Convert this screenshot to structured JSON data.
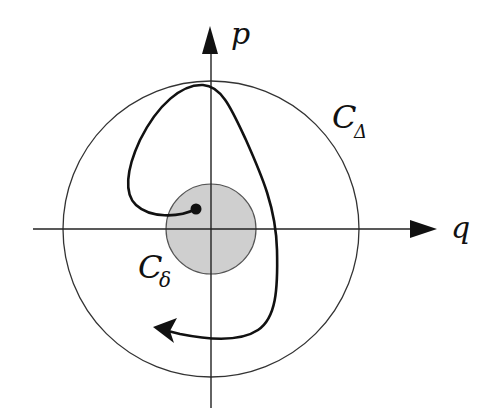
{
  "diagram": {
    "type": "phase-portrait",
    "axes": {
      "horizontal_label": "q",
      "vertical_label": "p"
    },
    "regions": [
      {
        "name": "outer-circle",
        "label": "C",
        "subscript": "Δ",
        "fill": "none",
        "stroke": "#333333"
      },
      {
        "name": "inner-disk",
        "label": "C",
        "subscript": "δ",
        "fill": "#cfcfcf",
        "stroke": "#555555"
      }
    ],
    "trajectory": {
      "start": "inside inner disk (dot)",
      "direction": "clockwise loop, exits toward lower-left with arrowhead"
    },
    "colors": {
      "ink": "#111111",
      "disk_fill": "#cfcfcf",
      "background": "#ffffff"
    }
  }
}
